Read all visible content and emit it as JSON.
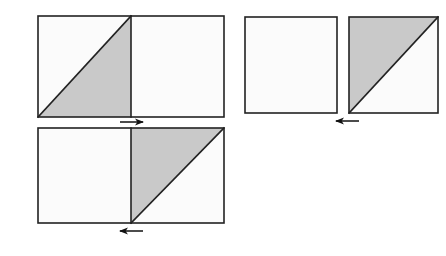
{
  "figure": {
    "title": "Square dissection transformation diagram",
    "background_color": "#ffffff",
    "width": 446,
    "height": 256,
    "stroke_color": "#222222",
    "shade_color": "#c9c9c9",
    "blank_color": "#fbfbfb",
    "stroke_width": 1.6,
    "arrow_color": "#111111"
  },
  "panels": [
    {
      "id": "panel-top-left",
      "name": "top-left-double-square",
      "label": "",
      "x": 38,
      "y": 16,
      "width": 186,
      "height": 101,
      "cells": [
        {
          "name": "left-cell",
          "x": 38,
          "y": 16,
          "width": 93,
          "height": 101,
          "fill": "#fbfbfb",
          "diagonal": "bottom-left-to-top-right",
          "shaded_half": "lower-right",
          "shade_color": "#c9c9c9"
        },
        {
          "name": "right-cell",
          "x": 131,
          "y": 16,
          "width": 93,
          "height": 101,
          "fill": "#fbfbfb",
          "diagonal": "none",
          "shaded_half": "none",
          "shade_color": "#c9c9c9"
        }
      ]
    },
    {
      "id": "panel-bottom-left",
      "name": "bottom-left-double-square",
      "label": "",
      "x": 38,
      "y": 128,
      "width": 186,
      "height": 95,
      "cells": [
        {
          "name": "left-cell",
          "x": 38,
          "y": 128,
          "width": 93,
          "height": 95,
          "fill": "#fbfbfb",
          "diagonal": "none",
          "shaded_half": "none",
          "shade_color": "#c9c9c9"
        },
        {
          "name": "right-cell",
          "x": 131,
          "y": 128,
          "width": 93,
          "height": 95,
          "fill": "#fbfbfb",
          "diagonal": "bottom-left-to-top-right",
          "shaded_half": "upper-left",
          "shade_color": "#c9c9c9"
        }
      ]
    },
    {
      "id": "panel-right-plain",
      "name": "right-plain-square",
      "label": "",
      "x": 245,
      "y": 17,
      "width": 92,
      "height": 96,
      "cells": [
        {
          "name": "only-cell",
          "x": 245,
          "y": 17,
          "width": 92,
          "height": 96,
          "fill": "#fbfbfb",
          "diagonal": "none",
          "shaded_half": "none",
          "shade_color": "#c9c9c9"
        }
      ]
    },
    {
      "id": "panel-right-split",
      "name": "right-split-square",
      "label": "",
      "x": 349,
      "y": 17,
      "width": 89,
      "height": 96,
      "cells": [
        {
          "name": "only-cell",
          "x": 349,
          "y": 17,
          "width": 89,
          "height": 96,
          "fill": "#fbfbfb",
          "diagonal": "bottom-left-to-top-right",
          "shaded_half": "upper-left",
          "shade_color": "#c9c9c9"
        }
      ]
    }
  ],
  "arrows": [
    {
      "id": "arrow-top-left",
      "name": "arrow-right-top-left-panel",
      "direction": "right",
      "x1": 120,
      "x2": 143,
      "y": 122,
      "label": ""
    },
    {
      "id": "arrow-bottom-left",
      "name": "arrow-left-bottom-left-panel",
      "direction": "left",
      "x1": 120,
      "x2": 143,
      "y": 231,
      "label": ""
    },
    {
      "id": "arrow-right-group",
      "name": "arrow-left-right-group",
      "direction": "left",
      "x1": 336,
      "x2": 359,
      "y": 121,
      "label": ""
    }
  ]
}
